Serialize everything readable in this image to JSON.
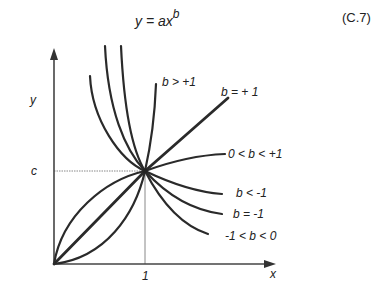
{
  "equation": {
    "lhs": "y = ax",
    "exponent": "b",
    "number": "(C.7)"
  },
  "axes": {
    "x_label": "x",
    "y_label": "y",
    "x_tick": "1",
    "y_tick": "c"
  },
  "curves": [
    {
      "label": "b > +1"
    },
    {
      "label": "b = + 1"
    },
    {
      "label": "0 < b < +1"
    },
    {
      "label": "b < -1"
    },
    {
      "label": "b = -1"
    },
    {
      "label": "-1 < b < 0"
    }
  ]
}
